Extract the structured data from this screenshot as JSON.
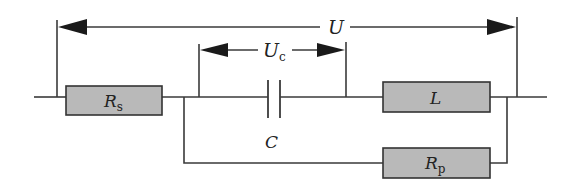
{
  "diagram": {
    "labels": {
      "total_voltage": "U",
      "capacitor_voltage_main": "U",
      "capacitor_voltage_sub": "c",
      "series_resistor_main": "R",
      "series_resistor_sub": "s",
      "inductor": "L",
      "capacitor": "C",
      "parallel_resistor_main": "R",
      "parallel_resistor_sub": "p"
    },
    "colors": {
      "component_fill": "#b9b9b9",
      "line": "#3a3a3a",
      "arrow": "#1a1a1a",
      "background": "#ffffff"
    },
    "components": [
      {
        "id": "Rs",
        "type": "resistor",
        "label": "Rs",
        "position": "series-left"
      },
      {
        "id": "C",
        "type": "capacitor",
        "label": "C",
        "position": "series-middle"
      },
      {
        "id": "L",
        "type": "inductor",
        "label": "L",
        "position": "series-right"
      },
      {
        "id": "Rp",
        "type": "resistor",
        "label": "Rp",
        "position": "parallel-branch (across C and L)"
      }
    ],
    "measurements": [
      {
        "id": "U",
        "label": "U",
        "spans": "entire circuit"
      },
      {
        "id": "Uc",
        "label": "Uc",
        "spans": "capacitor C"
      }
    ]
  }
}
